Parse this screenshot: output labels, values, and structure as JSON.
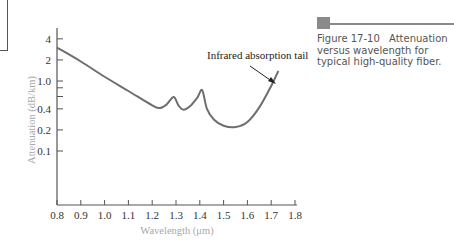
{
  "figure": {
    "number": "Figure 17-10",
    "caption": "Attenuation versus wavelength for typical high-quality fiber.",
    "accent_color": "#8a8a8a"
  },
  "chart_data": {
    "type": "line",
    "title": "",
    "xlabel": "Wavelength (μm)",
    "ylabel": "Attenuation (dB/km)",
    "x_ticks": [
      "0.8",
      "0.9",
      "1.0",
      "1.1",
      "1.2",
      "1.3",
      "1.4",
      "1.5",
      "1.6",
      "1.7",
      "1.8"
    ],
    "y_ticks": [
      "4",
      "2",
      "1.0",
      "0.4",
      "0.2",
      "0.1"
    ],
    "y_minor_ticks": [
      0.8,
      0.6
    ],
    "xlim": [
      0.8,
      1.8
    ],
    "yscale": "log",
    "grid": false,
    "series": [
      {
        "name": "Attenuation",
        "color": "#6e6e6e",
        "x": [
          0.8,
          0.9,
          1.0,
          1.1,
          1.2,
          1.23,
          1.26,
          1.29,
          1.31,
          1.33,
          1.36,
          1.39,
          1.41,
          1.43,
          1.46,
          1.5,
          1.55,
          1.6,
          1.65,
          1.7,
          1.73
        ],
        "y": [
          3.0,
          1.9,
          1.15,
          0.72,
          0.45,
          0.41,
          0.46,
          0.59,
          0.45,
          0.39,
          0.44,
          0.58,
          0.74,
          0.4,
          0.28,
          0.23,
          0.22,
          0.26,
          0.42,
          0.85,
          1.39
        ]
      }
    ],
    "annotations": [
      {
        "text": "Infrared absorption tail",
        "arrow_to_x": 1.69,
        "arrow_to_y": 0.8
      }
    ]
  }
}
